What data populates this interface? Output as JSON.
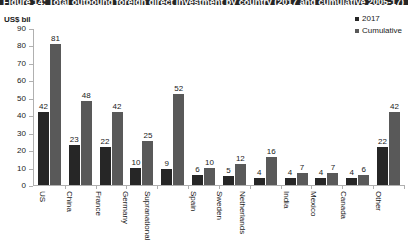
{
  "title_banner": {
    "text": "Figure 14: Total outbound foreign direct investment by country (2017 and cumulative 2005-17)"
  },
  "axis_unit_label": "US$ bil",
  "legend": {
    "items": [
      {
        "label": "2017",
        "color": "#262626"
      },
      {
        "label": "Cumulative",
        "color": "#595959"
      }
    ]
  },
  "chart_data": {
    "type": "bar",
    "title": "Figure 14: Total outbound foreign direct investment by country (2017 and cumulative 2005-17)",
    "xlabel": "",
    "ylabel": "US$ bil",
    "ylim": [
      0,
      90
    ],
    "yticks": [
      0,
      10,
      20,
      30,
      40,
      50,
      60,
      70,
      80,
      90
    ],
    "grid": false,
    "legend_position": "top-right",
    "categories": [
      "US",
      "China",
      "France",
      "Germany",
      "Supranational",
      "Spain",
      "Sweden",
      "Netherlands",
      "India",
      "Mexico",
      "Canada",
      "Other"
    ],
    "series": [
      {
        "name": "2017",
        "color": "#262626",
        "values": [
          42,
          23,
          22,
          10,
          9,
          6,
          5,
          4,
          4,
          4,
          4,
          22
        ]
      },
      {
        "name": "Cumulative",
        "color": "#595959",
        "values": [
          81,
          48,
          42,
          25,
          52,
          10,
          12,
          16,
          7,
          7,
          6,
          42
        ]
      }
    ]
  }
}
